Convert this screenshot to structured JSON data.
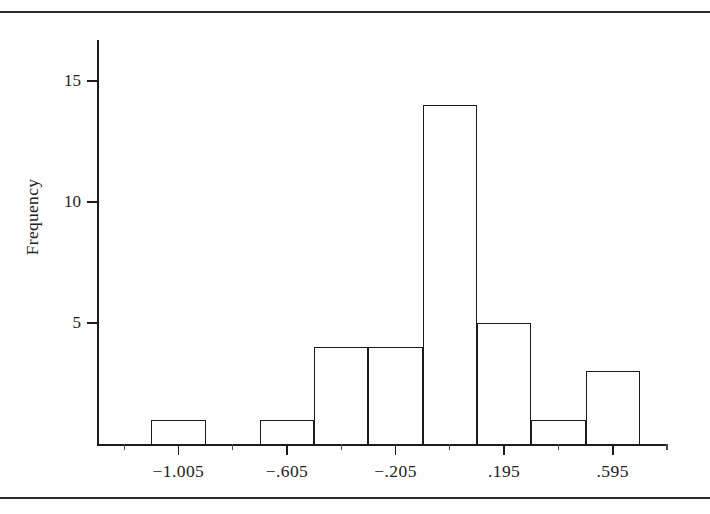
{
  "figure": {
    "background_color": "#fefefe",
    "ink_color": "#1b1b1b",
    "rule_top_label": "page-rule-top",
    "rule_bottom_label": "page-rule-bottom"
  },
  "chart_data": {
    "type": "bar",
    "subtype": "histogram",
    "title": "",
    "xlabel": "",
    "ylabel": "Frequency",
    "grid": false,
    "legend": false,
    "legend_position": "none",
    "xlim": [
      -1.305,
      0.795
    ],
    "ylim": [
      0,
      17
    ],
    "bin_width": 0.2,
    "x_tick_labels": [
      "-1.005",
      "-.605",
      "-.205",
      ".195",
      ".595"
    ],
    "x_tick_values": [
      -1.005,
      -0.605,
      -0.205,
      0.195,
      0.595
    ],
    "x_minor_tick_values": [
      -1.205,
      -0.805,
      -0.405,
      -0.005,
      0.395,
      0.795
    ],
    "x_tick_interval": 0.4,
    "y_tick_labels": [
      "5",
      "10",
      "15"
    ],
    "y_tick_values": [
      5,
      10,
      15
    ],
    "categories": [
      "-1.105 to -0.905",
      "-0.905 to -0.705",
      "-0.705 to -0.505",
      "-0.505 to -0.305",
      "-0.305 to -0.105",
      "-0.105 to 0.095",
      "0.095 to 0.295",
      "0.295 to 0.495",
      "0.495 to 0.695"
    ],
    "bin_starts": [
      -1.105,
      -0.905,
      -0.705,
      -0.505,
      -0.305,
      -0.105,
      0.095,
      0.295,
      0.495
    ],
    "bin_ends": [
      -0.905,
      -0.705,
      -0.505,
      -0.305,
      -0.105,
      0.095,
      0.295,
      0.495,
      0.695
    ],
    "values": [
      1,
      0,
      1,
      4,
      4,
      14,
      5,
      1,
      3
    ],
    "total_count": 33
  },
  "bars": [
    {
      "name": "bin-1",
      "label": "-1.105 to -0.905",
      "value": 1
    },
    {
      "name": "bin-2",
      "label": "-0.905 to -0.705",
      "value": 0
    },
    {
      "name": "bin-3",
      "label": "-0.705 to -0.505",
      "value": 1
    },
    {
      "name": "bin-4",
      "label": "-0.505 to -0.305",
      "value": 4
    },
    {
      "name": "bin-5",
      "label": "-0.305 to -0.105",
      "value": 4
    },
    {
      "name": "bin-6",
      "label": "-0.105 to 0.095",
      "value": 14
    },
    {
      "name": "bin-7",
      "label": "0.095 to 0.295",
      "value": 5
    },
    {
      "name": "bin-8",
      "label": "0.295 to 0.495",
      "value": 1
    },
    {
      "name": "bin-9",
      "label": "0.495 to 0.695",
      "value": 3
    }
  ]
}
